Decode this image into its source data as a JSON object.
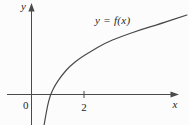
{
  "figure": {
    "curve_label": "y = f(x)",
    "y_axis_label": "y",
    "x_axis_label": "x",
    "origin_label": "0"
  },
  "colors": {
    "line": "#4a4a4a",
    "text": "#1f1f1f",
    "background": "#fcfcfc"
  },
  "chart_data": {
    "type": "line",
    "title": "",
    "xlabel": "x",
    "ylabel": "y",
    "grid": false,
    "legend": "none",
    "origin_label": "0",
    "x_ticks": [
      {
        "value": 2,
        "label": "2"
      }
    ],
    "y_ticks": [],
    "xlim": [
      -0.9,
      6.1
    ],
    "ylim": [
      -1.2,
      3.5
    ],
    "annotation": "Increasing concave logarithm-like curve crossing the x-axis near x = 0.7",
    "series": [
      {
        "name": "y = f(x)",
        "x": [
          0.48,
          0.59,
          0.72,
          0.9,
          1.16,
          1.47,
          1.85,
          2.23,
          2.8,
          3.37,
          4.13,
          4.9,
          5.92
        ],
        "y": [
          -1.16,
          -0.51,
          0.0,
          0.36,
          0.74,
          1.09,
          1.39,
          1.62,
          1.96,
          2.19,
          2.46,
          2.69,
          3.03
        ]
      }
    ]
  }
}
